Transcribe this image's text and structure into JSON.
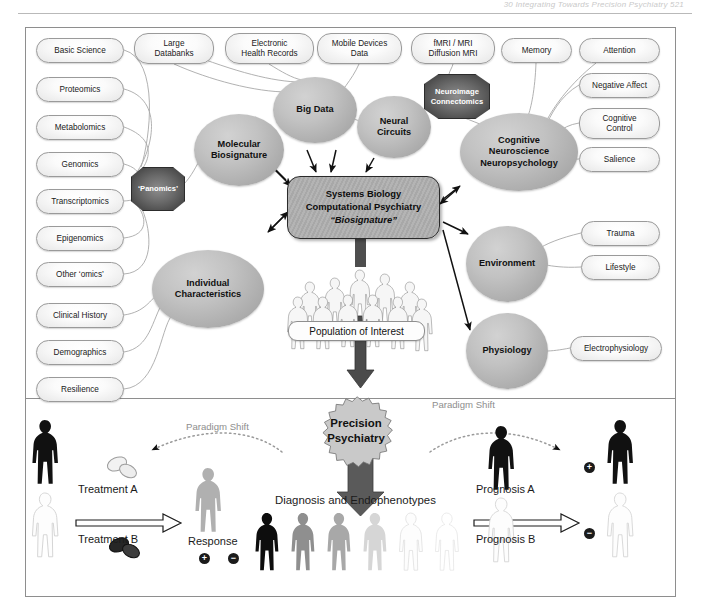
{
  "running_head": {
    "text": "30    Integrating Towards Precision Psychiatry    521"
  },
  "core": {
    "line1": "Systems Biology",
    "line2": "Computational Psychiatry",
    "line3": "“Biosignature”"
  },
  "hubs": [
    {
      "id": "big-data",
      "label": "Big Data",
      "x": 273,
      "y": 77,
      "w": 84,
      "h": 66
    },
    {
      "id": "neural-circuits",
      "label": "Neural\nCircuits",
      "x": 357,
      "y": 96,
      "w": 74,
      "h": 62
    },
    {
      "id": "molecular",
      "label": "Molecular\nBiosignature",
      "x": 194,
      "y": 114,
      "w": 90,
      "h": 72
    },
    {
      "id": "cognitive",
      "label": "Cognitive\nNeuroscience\nNeuropsychology",
      "x": 460,
      "y": 113,
      "w": 118,
      "h": 78
    },
    {
      "id": "individual",
      "label": "Individual\nCharacteristics",
      "x": 152,
      "y": 250,
      "w": 112,
      "h": 78
    },
    {
      "id": "environment",
      "label": "Environment",
      "x": 466,
      "y": 226,
      "w": 82,
      "h": 76
    },
    {
      "id": "physiology",
      "label": "Physiology",
      "x": 466,
      "y": 313,
      "w": 82,
      "h": 76
    }
  ],
  "octagons": [
    {
      "id": "panomics",
      "label": "‘Panomics’",
      "x": 131,
      "y": 167,
      "w": 52,
      "h": 42
    },
    {
      "id": "neuroimage",
      "label": "Neuroimage\nConnectomics",
      "x": 424,
      "y": 74,
      "w": 64,
      "h": 43
    }
  ],
  "pills": [
    {
      "id": "basic-science",
      "label": "Basic Science",
      "x": 36,
      "y": 38,
      "w": 88,
      "h": 25
    },
    {
      "id": "large-databanks",
      "label": "Large\nDatabanks",
      "x": 134,
      "y": 33,
      "w": 80,
      "h": 31
    },
    {
      "id": "ehr",
      "label": "Electronic\nHealth Records",
      "x": 225,
      "y": 33,
      "w": 89,
      "h": 31
    },
    {
      "id": "mobile-devices",
      "label": "Mobile Devices\nData",
      "x": 317,
      "y": 33,
      "w": 85,
      "h": 31
    },
    {
      "id": "fmri-mri",
      "label": "fMRI / MRI\nDiffusion MRI",
      "x": 411,
      "y": 33,
      "w": 84,
      "h": 31
    },
    {
      "id": "memory",
      "label": "Memory",
      "x": 501,
      "y": 38,
      "w": 71,
      "h": 25
    },
    {
      "id": "attention",
      "label": "Attention",
      "x": 579,
      "y": 38,
      "w": 81,
      "h": 25
    },
    {
      "id": "proteomics",
      "label": "Proteomics",
      "x": 36,
      "y": 77,
      "w": 88,
      "h": 25
    },
    {
      "id": "negative-affect",
      "label": "Negative Affect",
      "x": 579,
      "y": 73,
      "w": 81,
      "h": 25
    },
    {
      "id": "metabolomics",
      "label": "Metabolomics",
      "x": 36,
      "y": 115,
      "w": 88,
      "h": 25
    },
    {
      "id": "cognitive-control",
      "label": "Cognitive\nControl",
      "x": 579,
      "y": 108,
      "w": 81,
      "h": 31
    },
    {
      "id": "genomics",
      "label": "Genomics",
      "x": 36,
      "y": 152,
      "w": 88,
      "h": 25
    },
    {
      "id": "salience",
      "label": "Salience",
      "x": 579,
      "y": 147,
      "w": 81,
      "h": 25
    },
    {
      "id": "transcriptomics",
      "label": "Transcriptomics",
      "x": 36,
      "y": 189,
      "w": 88,
      "h": 25
    },
    {
      "id": "epigenomics",
      "label": "Epigenomics",
      "x": 36,
      "y": 226,
      "w": 88,
      "h": 25
    },
    {
      "id": "trauma",
      "label": "Trauma",
      "x": 581,
      "y": 221,
      "w": 79,
      "h": 25
    },
    {
      "id": "other-omics",
      "label": "Other ‘omics’",
      "x": 36,
      "y": 262,
      "w": 88,
      "h": 25
    },
    {
      "id": "lifestyle",
      "label": "Lifestyle",
      "x": 581,
      "y": 255,
      "w": 79,
      "h": 25
    },
    {
      "id": "clinical-history",
      "label": "Clinical History",
      "x": 36,
      "y": 303,
      "w": 88,
      "h": 25
    },
    {
      "id": "electrophysiology",
      "label": "Electrophysiology",
      "x": 570,
      "y": 336,
      "w": 92,
      "h": 25
    },
    {
      "id": "demographics",
      "label": "Demographics",
      "x": 36,
      "y": 340,
      "w": 88,
      "h": 25
    },
    {
      "id": "resilience",
      "label": "Resilience",
      "x": 36,
      "y": 377,
      "w": 88,
      "h": 25
    }
  ],
  "population": {
    "label": "Population of Interest"
  },
  "precision": {
    "line1": "Precision",
    "line2": "Psychiatry"
  },
  "paradigm_shift": {
    "left_label": "Paradigm Shift",
    "right_label": "Paradigm Shift"
  },
  "bottom": {
    "treatment_a": "Treatment A",
    "treatment_b": "Treatment B",
    "response": "Response",
    "response_plus": "+",
    "response_minus": "−",
    "diagnosis": "Diagnosis and Endophenotypes",
    "prognosis_a": "Prognosis A",
    "prognosis_b": "Prognosis B",
    "prognosis_plus": "+",
    "prognosis_minus": "−"
  },
  "colors": {
    "frame": "#8e8e8e",
    "hub_fill": "#b8b8b8",
    "core_fill": "#ababab",
    "dark_node": "#4a4a4a",
    "paradigm_text": "#8e8e8e",
    "arrow": "#111111"
  },
  "chart_data": {
    "type": "diagram",
    "title": "Integrating Towards Precision Psychiatry"
  }
}
